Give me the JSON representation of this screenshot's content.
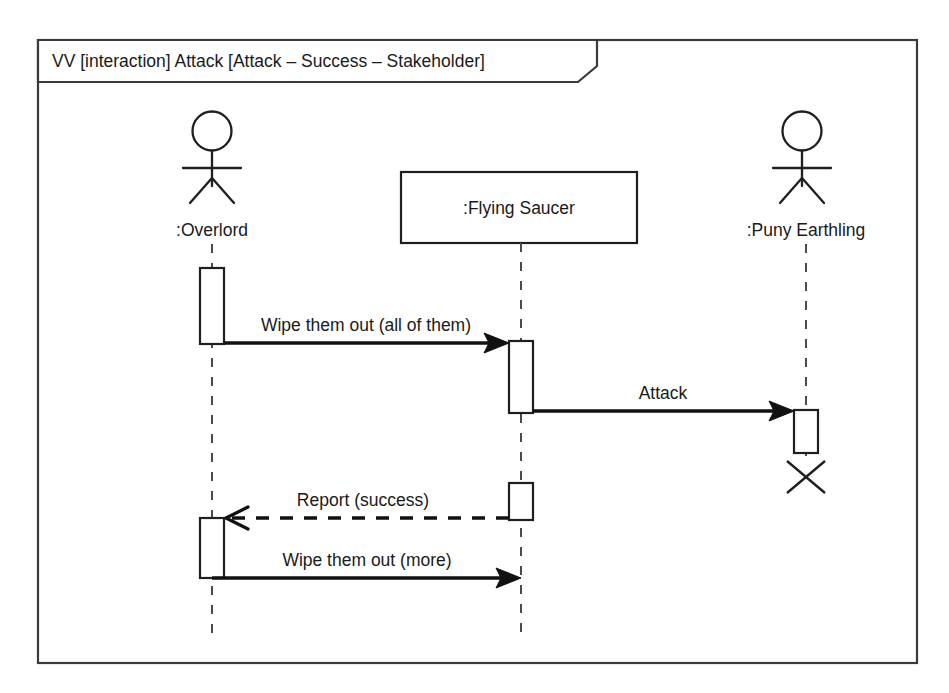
{
  "diagram": {
    "kind": "uml-sequence-diagram",
    "frame": {
      "header_label": "VV [interaction] Attack [Attack – Success – Stakeholder]"
    },
    "participants": [
      {
        "id": "overlord",
        "label": ":Overlord",
        "shape": "actor",
        "x": 212
      },
      {
        "id": "flying_saucer",
        "label": ":Flying Saucer",
        "shape": "object-box",
        "x": 521
      },
      {
        "id": "puny_earthling",
        "label": ":Puny Earthling",
        "shape": "actor",
        "x": 806
      }
    ],
    "messages": [
      {
        "id": "msg-1",
        "label": "Wipe them out (all of them)",
        "from": "overlord",
        "to": "flying_saucer",
        "style": "solid",
        "arrowhead": "filled",
        "y": 343
      },
      {
        "id": "msg-2",
        "label": "Attack",
        "from": "flying_saucer",
        "to": "puny_earthling",
        "style": "solid",
        "arrowhead": "filled",
        "y": 411
      },
      {
        "id": "msg-3",
        "label": "Report (success)",
        "from": "flying_saucer",
        "to": "overlord",
        "style": "dashed",
        "arrowhead": "open",
        "y": 518
      },
      {
        "id": "msg-4",
        "label": "Wipe them out (more)",
        "from": "overlord",
        "to": "flying_saucer",
        "style": "solid",
        "arrowhead": "filled",
        "y": 578
      }
    ],
    "destruction_marker": {
      "participant": "puny_earthling",
      "symbol": "X"
    },
    "colors": {
      "background": "#ffffff",
      "stroke": "#1f1f1f",
      "frame_stroke": "#3a3a3a",
      "lifeline": "#4a4a4a",
      "text": "#1a1a1a"
    }
  }
}
